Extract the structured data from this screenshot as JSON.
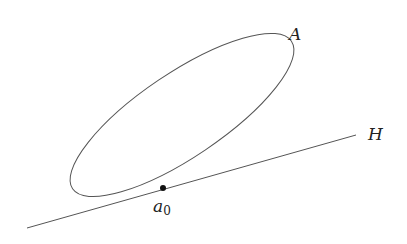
{
  "diagram": {
    "labels": {
      "curve": "A",
      "line": "H",
      "point_main": "a",
      "point_sub": "0"
    },
    "colors": {
      "stroke": "#555555",
      "text": "#222222",
      "point": "#111111"
    },
    "ellipse": {
      "cx": 182,
      "cy": 115,
      "rx": 132,
      "ry": 42,
      "rotate": -34
    },
    "line": {
      "x1": 27,
      "y1": 228,
      "x2": 356,
      "y2": 135
    },
    "point": {
      "x": 163,
      "y": 188,
      "r": 3
    }
  }
}
